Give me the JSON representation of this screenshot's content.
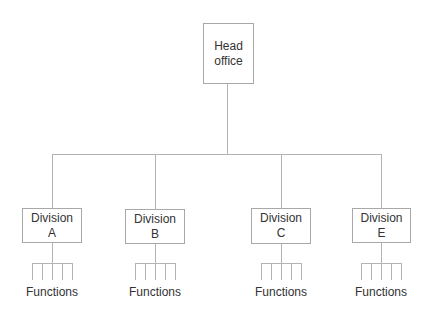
{
  "diagram": {
    "type": "org-chart",
    "root": {
      "line1": "Head",
      "line2": "office"
    },
    "divisions": [
      {
        "line1": "Division",
        "line2": "A",
        "functions_label": "Functions"
      },
      {
        "line1": "Division",
        "line2": "B",
        "functions_label": "Functions"
      },
      {
        "line1": "Division",
        "line2": "C",
        "functions_label": "Functions"
      },
      {
        "line1": "Division",
        "line2": "E",
        "functions_label": "Functions"
      }
    ],
    "colors": {
      "line": "#b3b3b3",
      "text": "#333333",
      "border": "#a8a8a8"
    }
  }
}
